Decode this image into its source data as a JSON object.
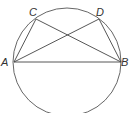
{
  "diagram": {
    "type": "inscribed-quadrilateral",
    "circle": {
      "cx": 67,
      "cy": 62,
      "r": 54,
      "stroke": "#555555"
    },
    "points": {
      "A": {
        "label": "A",
        "x": 14,
        "y": 62
      },
      "B": {
        "label": "B",
        "x": 121,
        "y": 62
      },
      "C": {
        "label": "C",
        "x": 36,
        "y": 19
      },
      "D": {
        "label": "D",
        "x": 99,
        "y": 19
      }
    },
    "segments": [
      "AB",
      "AC",
      "AD",
      "BC",
      "BD"
    ],
    "line_color": "#444444"
  }
}
